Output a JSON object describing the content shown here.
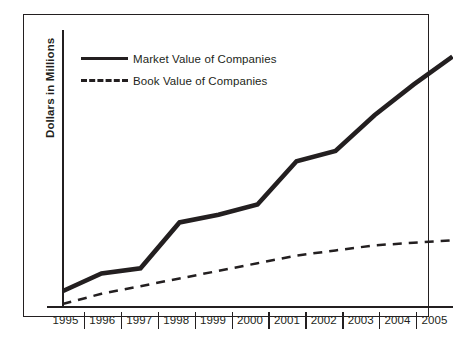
{
  "chart_data": {
    "type": "line",
    "title": "",
    "xlabel": "",
    "ylabel": "Dollars in Millions",
    "grid": false,
    "legend_position": "top-left",
    "categories": [
      "1995",
      "1996",
      "1997",
      "1998",
      "1999",
      "2000",
      "2001",
      "2002",
      "2003",
      "2004",
      "2005"
    ],
    "x": [
      1995,
      1996,
      1997,
      1998,
      1999,
      2000,
      2001,
      2002,
      2003,
      2004,
      2005
    ],
    "ylim": [
      0,
      100
    ],
    "y_axis_ticks_shown": false,
    "series": [
      {
        "name": "Market Value of Companies",
        "style": "solid",
        "color": "#231f20",
        "line_width": 4,
        "values": [
          5,
          12,
          14,
          32,
          35,
          39,
          56,
          60,
          74,
          86,
          97
        ]
      },
      {
        "name": "Book Value of Companies",
        "style": "dashed",
        "color": "#231f20",
        "line_width": 2,
        "values": [
          0,
          4,
          7,
          10,
          13,
          16,
          19,
          21,
          23,
          24,
          25
        ]
      }
    ]
  },
  "legend": {
    "items": [
      {
        "label": "Market Value of Companies",
        "swatch": "solid-line-swatch"
      },
      {
        "label": "Book Value of Companies",
        "swatch": "dashed-line-swatch"
      }
    ]
  },
  "axes": {
    "y_title": "Dollars in Millions",
    "x_labels": [
      "1995",
      "1996",
      "1997",
      "1998",
      "1999",
      "2000",
      "2001",
      "2002",
      "2003",
      "2004",
      "2005"
    ]
  },
  "colors": {
    "ink": "#231f20",
    "background": "#ffffff"
  }
}
